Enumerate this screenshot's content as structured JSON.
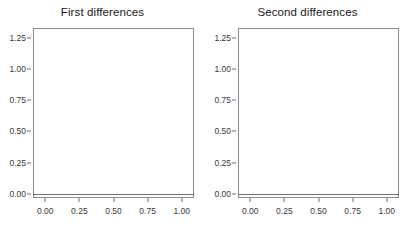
{
  "figure": {
    "background": "#ffffff",
    "panel_border_color": "#8c8c8c",
    "grid_color": "#f2f2f2",
    "line_color": "#3d3d3d",
    "point_fill": "#8a8a8a",
    "open_circle_stroke": "#3d3d3d"
  },
  "panels": [
    {
      "title": "First differences"
    },
    {
      "title": "Second differences"
    }
  ],
  "axes": {
    "x_ticks": [
      "0.00",
      "0.25",
      "0.50",
      "0.75",
      "1.00"
    ],
    "x_tick_values": [
      0.0,
      0.25,
      0.5,
      0.75,
      1.0
    ],
    "y_ticks": [
      "0.00",
      "0.25",
      "0.50",
      "0.75",
      "1.00",
      "1.25"
    ],
    "y_tick_values": [
      0.0,
      0.25,
      0.5,
      0.75,
      1.0,
      1.25
    ],
    "xlim": [
      -0.09,
      1.09
    ],
    "ylim": [
      -0.035,
      1.33
    ]
  },
  "chart_data": [
    {
      "type": "scatter",
      "title": "First differences",
      "xlabel": "",
      "ylabel": "",
      "xlim": [
        -0.09,
        1.09
      ],
      "ylim": [
        -0.035,
        1.33
      ],
      "grid": true,
      "legend": "none",
      "x_ticks": [
        0.0,
        0.25,
        0.5,
        0.75,
        1.0
      ],
      "y_ticks": [
        0.0,
        0.25,
        0.5,
        0.75,
        1.0,
        1.25
      ],
      "series": [
        {
          "name": "fitted curve with open circles",
          "style": "line-with-open-circles",
          "x": [
            -0.05,
            -0.01,
            0.02,
            0.05,
            0.08,
            0.11,
            0.14,
            0.17,
            0.2,
            0.22,
            0.24,
            0.26,
            0.28,
            0.3,
            0.32,
            0.34,
            0.36,
            0.38,
            0.41,
            0.44,
            0.47,
            0.5,
            0.53,
            0.56,
            0.59,
            0.62,
            0.65,
            0.68,
            0.7,
            0.72,
            0.74,
            0.76,
            0.78,
            0.81,
            0.84,
            0.87,
            0.9,
            0.93,
            0.96,
            0.99,
            1.02,
            1.04
          ],
          "y": [
            0.683,
            0.683,
            0.683,
            0.683,
            0.683,
            0.684,
            0.684,
            0.685,
            0.688,
            0.7,
            0.735,
            0.785,
            0.838,
            0.882,
            0.92,
            0.952,
            0.979,
            1.002,
            1.03,
            1.055,
            1.077,
            1.097,
            1.116,
            1.134,
            1.15,
            1.165,
            1.177,
            1.186,
            1.182,
            1.168,
            1.152,
            1.141,
            1.135,
            1.132,
            1.131,
            1.131,
            1.131,
            1.131,
            1.131,
            1.131,
            1.131,
            1.131
          ]
        },
        {
          "name": "observed points",
          "style": "filled-gray-dots",
          "x": [
            0.225,
            0.235,
            0.245,
            0.25,
            0.255,
            0.265,
            0.275,
            0.285,
            0.295,
            0.3,
            0.305,
            0.315,
            0.325,
            0.335,
            0.34,
            0.345,
            0.355,
            0.365,
            0.375,
            0.385,
            0.4,
            0.42,
            0.45,
            0.48,
            0.52,
            0.56,
            0.6,
            0.635,
            0.665,
            0.68,
            0.69,
            0.695,
            0.7,
            0.715,
            0.73,
            0.745,
            0.755,
            0.765,
            0.775,
            0.785
          ],
          "y": [
            0.628,
            0.706,
            0.718,
            0.735,
            0.745,
            0.76,
            0.775,
            0.788,
            0.8,
            0.838,
            0.855,
            0.87,
            0.93,
            1.02,
            1.038,
            1.04,
            0.99,
            1.0,
            1.008,
            1.015,
            1.03,
            1.045,
            1.062,
            1.08,
            1.105,
            1.13,
            1.152,
            1.172,
            1.188,
            1.195,
            1.19,
            1.178,
            1.17,
            1.155,
            1.142,
            1.13,
            1.128,
            1.135,
            1.14,
            1.132
          ]
        }
      ]
    },
    {
      "type": "scatter",
      "title": "Second differences",
      "xlabel": "",
      "ylabel": "",
      "xlim": [
        -0.09,
        1.09
      ],
      "ylim": [
        -0.035,
        1.33
      ],
      "grid": true,
      "legend": "none",
      "x_ticks": [
        0.0,
        0.25,
        0.5,
        0.75,
        1.0
      ],
      "y_ticks": [
        0.0,
        0.25,
        0.5,
        0.75,
        1.0,
        1.25
      ],
      "series": [
        {
          "name": "fitted curve with open circles",
          "style": "line-with-open-circles",
          "x": [
            -0.03,
            0.005,
            0.03,
            0.06,
            0.09,
            0.12,
            0.15,
            0.18,
            0.21,
            0.24,
            0.27,
            0.3,
            0.33,
            0.36,
            0.39,
            0.42,
            0.45,
            0.48,
            0.51,
            0.54,
            0.57,
            0.6,
            0.63,
            0.66,
            0.69,
            0.71,
            0.73,
            0.76,
            0.79,
            0.82,
            0.85,
            0.88,
            0.91,
            0.94,
            0.97,
            1.0,
            1.04
          ],
          "y": [
            0.0,
            0.108,
            0.16,
            0.215,
            0.272,
            0.33,
            0.39,
            0.45,
            0.512,
            0.573,
            0.635,
            0.7,
            0.77,
            0.85,
            0.925,
            0.99,
            1.045,
            1.09,
            1.13,
            1.16,
            1.182,
            1.194,
            1.198,
            1.194,
            1.185,
            1.175,
            1.165,
            1.15,
            1.138,
            1.122,
            1.105,
            1.088,
            1.07,
            1.052,
            1.035,
            1.018,
            1.0
          ]
        },
        {
          "name": "observed points",
          "style": "filled-gray-dots",
          "x": [
            0.005,
            0.03,
            0.06,
            0.09,
            0.12,
            0.15,
            0.18,
            0.205,
            0.215,
            0.225,
            0.235,
            0.245,
            0.255,
            0.265,
            0.275,
            0.285,
            0.295,
            0.305,
            0.315,
            0.325,
            0.335,
            0.345,
            0.36,
            0.38,
            0.4,
            0.43,
            0.46,
            0.5,
            0.54,
            0.575,
            0.61,
            0.645,
            0.665,
            0.68,
            0.69,
            0.7,
            0.715,
            0.735,
            0.755,
            0.775,
            0.79,
            0.82,
            0.85,
            0.88,
            0.91,
            0.94,
            0.97,
            1.0
          ],
          "y": [
            0.105,
            0.16,
            0.215,
            0.272,
            0.33,
            0.388,
            0.45,
            0.628,
            0.64,
            0.67,
            0.69,
            0.71,
            0.735,
            0.755,
            0.76,
            0.79,
            0.775,
            0.8,
            0.87,
            0.94,
            1.03,
            1.04,
            0.92,
            0.96,
            1.0,
            1.045,
            1.078,
            1.118,
            1.155,
            1.178,
            1.192,
            1.194,
            1.182,
            1.19,
            1.196,
            1.178,
            1.165,
            1.158,
            1.15,
            1.128,
            1.118,
            1.105,
            1.09,
            1.072,
            1.055,
            1.038,
            1.02,
            1.002
          ]
        }
      ]
    }
  ]
}
